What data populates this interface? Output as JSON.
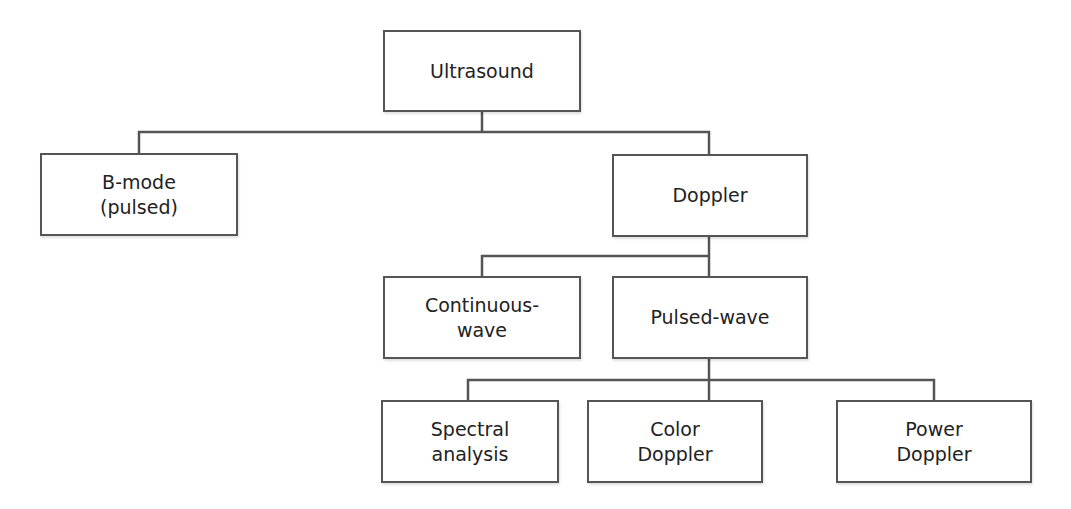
{
  "diagram": {
    "type": "hierarchy-tree",
    "line_color": "#555555",
    "nodes": {
      "ultrasound": {
        "label": "Ultrasound"
      },
      "bmode": {
        "label": "B-mode\n(pulsed)"
      },
      "doppler": {
        "label": "Doppler"
      },
      "continuous": {
        "label": "Continuous-\nwave"
      },
      "pulsed": {
        "label": "Pulsed-wave"
      },
      "spectral": {
        "label": "Spectral\nanalysis"
      },
      "color": {
        "label": "Color\nDoppler"
      },
      "power": {
        "label": "Power\nDoppler"
      }
    },
    "edges": [
      [
        "Ultrasound",
        "B-mode (pulsed)"
      ],
      [
        "Ultrasound",
        "Doppler"
      ],
      [
        "Doppler",
        "Continuous-wave"
      ],
      [
        "Doppler",
        "Pulsed-wave"
      ],
      [
        "Pulsed-wave",
        "Spectral analysis"
      ],
      [
        "Pulsed-wave",
        "Color Doppler"
      ],
      [
        "Pulsed-wave",
        "Power Doppler"
      ]
    ]
  }
}
